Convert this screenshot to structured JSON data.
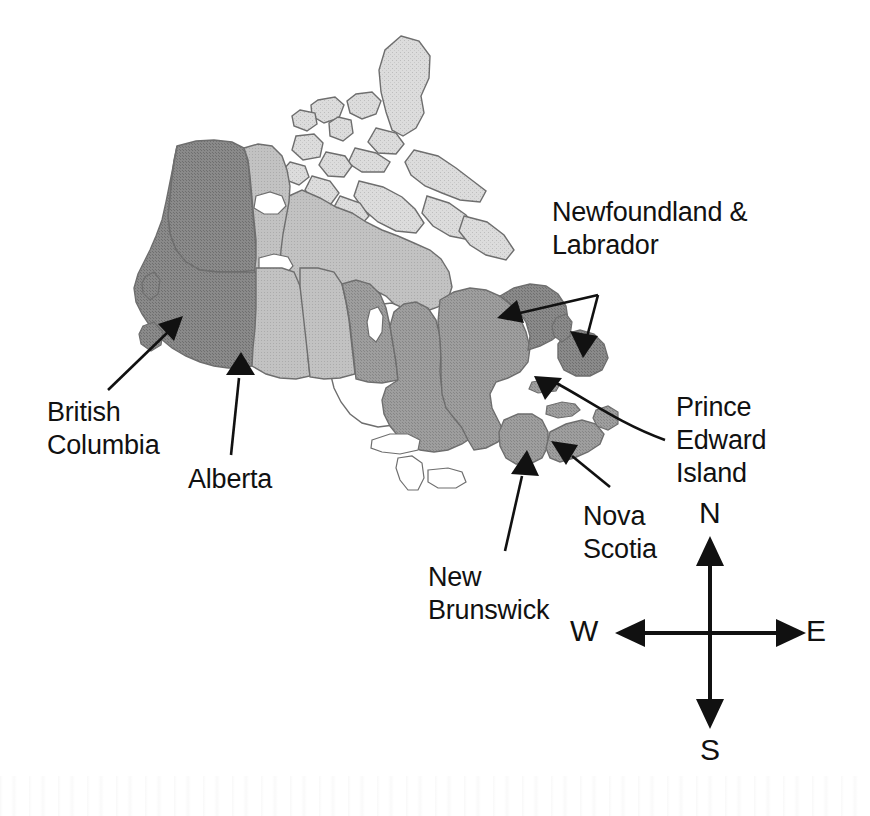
{
  "map": {
    "title": "Map of Canada",
    "region": "Canada",
    "labels": [
      {
        "id": "british-columbia",
        "lines": [
          "British",
          "Columbia"
        ],
        "text": "British\nColumbia",
        "points_to": "British Columbia"
      },
      {
        "id": "alberta",
        "lines": [
          "Alberta"
        ],
        "text": "Alberta",
        "points_to": "Alberta"
      },
      {
        "id": "newfoundland-labrador",
        "lines": [
          "Newfoundland &",
          "Labrador"
        ],
        "text": "Newfoundland &\nLabrador",
        "points_to": "Newfoundland and Labrador"
      },
      {
        "id": "prince-edward-island",
        "lines": [
          "Prince",
          "Edward",
          "Island"
        ],
        "text": "Prince\nEdward\nIsland",
        "points_to": "Prince Edward Island"
      },
      {
        "id": "nova-scotia",
        "lines": [
          "Nova",
          "Scotia"
        ],
        "text": "Nova\nScotia",
        "points_to": "Nova Scotia"
      },
      {
        "id": "new-brunswick",
        "lines": [
          "New",
          "Brunswick"
        ],
        "text": "New\nBrunswick",
        "points_to": "New Brunswick"
      }
    ],
    "colors": {
      "background": "#ffffff",
      "water": "#ffffff",
      "outline": "#595959",
      "text": "#111111",
      "shade_dark": "#8a8a8a",
      "shade_medium": "#9e9e9e",
      "shade_light": "#c2c2c2",
      "shade_lightest": "#d9d9d9"
    }
  },
  "compass": {
    "name": "compass-rose",
    "north": "N",
    "south": "S",
    "east": "E",
    "west": "W",
    "center_x": 710,
    "center_y": 633
  }
}
